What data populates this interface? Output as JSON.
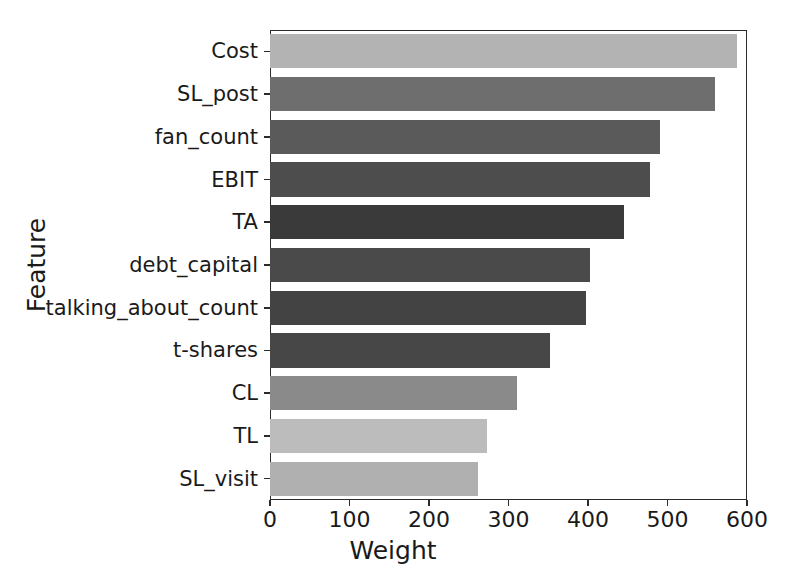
{
  "chart_data": {
    "type": "bar",
    "orientation": "horizontal",
    "title": "",
    "xlabel": "Weight",
    "ylabel": "Feature",
    "categories": [
      "Cost",
      "SL_post",
      "fan_count",
      "EBIT",
      "TA",
      "debt_capital",
      "talking_about_count",
      "t-shares",
      "CL",
      "TL",
      "SL_visit"
    ],
    "values": [
      588,
      560,
      490,
      478,
      445,
      402,
      398,
      352,
      311,
      273,
      262
    ],
    "bar_colors": [
      "#b3b3b3",
      "#6e6e6e",
      "#5a5a5a",
      "#4d4d4d",
      "#3a3a3a",
      "#4a4a4a",
      "#434343",
      "#474747",
      "#8a8a8a",
      "#bcbcbc",
      "#b0b0b0"
    ],
    "xlim": [
      0,
      600
    ],
    "ylim_categories": 11,
    "xticks": [
      0,
      100,
      200,
      300,
      400,
      500,
      600
    ],
    "xticklabels": [
      "0",
      "100",
      "200",
      "300",
      "400",
      "500",
      "600"
    ],
    "grid": false,
    "legend": false,
    "axis_color": "#2b2b2b",
    "background": "#ffffff"
  }
}
